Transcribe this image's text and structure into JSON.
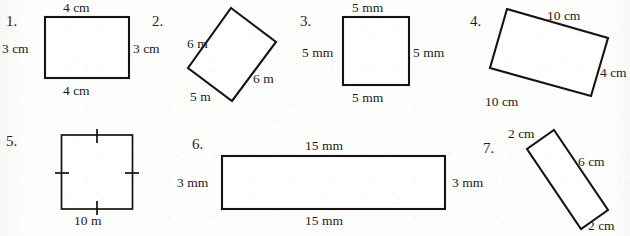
{
  "document": {
    "kind": "geometry-worksheet",
    "description": "Seven numbered rectangles and squares labelled with side lengths",
    "ink_color": "#141414",
    "paper_color": "#fdfdfc"
  },
  "figures": [
    {
      "number": "1.",
      "shape": "rectangle",
      "orientation": "upright",
      "labels": {
        "top": "4 cm",
        "left": "3 cm",
        "right": "3 cm",
        "bottom": "4 cm"
      },
      "tick_marks": false
    },
    {
      "number": "2.",
      "shape": "rectangle",
      "orientation": "rotated",
      "labels": {
        "upper_left": "6 m",
        "lower_right": "6 m",
        "lower_left": "5 m"
      },
      "tick_marks": false
    },
    {
      "number": "3.",
      "shape": "square",
      "orientation": "upright",
      "labels": {
        "top": "5 mm",
        "left": "5 mm",
        "right": "5 mm",
        "bottom": "5 mm"
      },
      "tick_marks": false
    },
    {
      "number": "4.",
      "shape": "rectangle",
      "orientation": "rotated",
      "labels": {
        "top": "10 cm",
        "right": "4 cm",
        "bottom": "10 cm"
      },
      "tick_marks": false
    },
    {
      "number": "5.",
      "shape": "square",
      "orientation": "upright",
      "labels": {
        "bottom": "10 m"
      },
      "tick_marks": true
    },
    {
      "number": "6.",
      "shape": "rectangle",
      "orientation": "upright",
      "labels": {
        "top": "15 mm",
        "left": "3 mm",
        "right": "3 mm",
        "bottom": "15 mm"
      },
      "tick_marks": false
    },
    {
      "number": "7.",
      "shape": "rectangle",
      "orientation": "rotated",
      "labels": {
        "upper_left": "2 cm",
        "upper_right": "6 cm",
        "lower_right": "2 cm"
      },
      "tick_marks": false
    }
  ]
}
